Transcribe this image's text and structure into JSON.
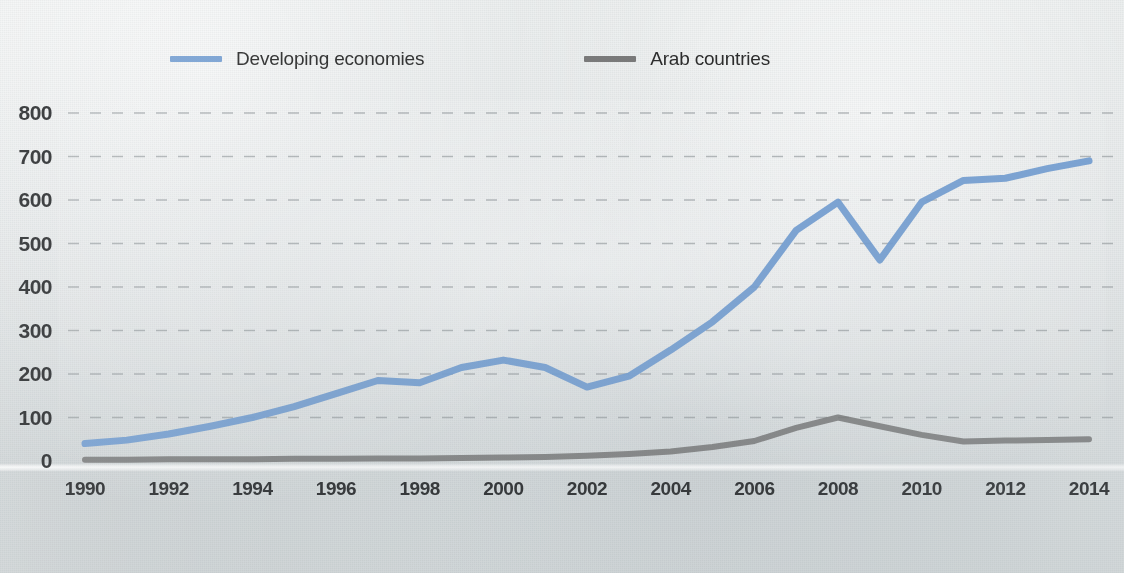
{
  "chart_data": {
    "type": "line",
    "title": "",
    "subtitle": "",
    "xlabel": "",
    "ylabel": "",
    "xlim": [
      1990,
      2014
    ],
    "ylim": [
      0,
      800
    ],
    "grid": true,
    "grid_style": "dashed-horizontal",
    "legend_position": "top-center",
    "x": [
      1990,
      1991,
      1992,
      1993,
      1994,
      1995,
      1996,
      1997,
      1998,
      1999,
      2000,
      2001,
      2002,
      2003,
      2004,
      2005,
      2006,
      2007,
      2008,
      2009,
      2010,
      2011,
      2012,
      2013,
      2014
    ],
    "y_ticks": [
      0,
      100,
      200,
      300,
      400,
      500,
      600,
      700,
      800
    ],
    "y_tick_labels": [
      "0",
      "100",
      "200",
      "300",
      "400",
      "500",
      "600",
      "700",
      "800"
    ],
    "x_ticks": [
      1990,
      1992,
      1994,
      1996,
      1998,
      2000,
      2002,
      2004,
      2006,
      2008,
      2010,
      2012,
      2014
    ],
    "x_tick_labels": [
      "1990",
      "1992",
      "1994",
      "1996",
      "1998",
      "2000",
      "2002",
      "2004",
      "2006",
      "2008",
      "2010",
      "2012",
      "2014"
    ],
    "series": [
      {
        "name": "Developing economies",
        "color": "#6f9bd1",
        "values": [
          40,
          48,
          62,
          80,
          100,
          125,
          155,
          185,
          180,
          215,
          232,
          215,
          170,
          195,
          255,
          320,
          400,
          530,
          595,
          462,
          595,
          645,
          650,
          672,
          690
        ]
      },
      {
        "name": "Arab countries",
        "color": "#6e6e6e",
        "values": [
          3,
          3,
          4,
          4,
          4,
          5,
          5,
          6,
          6,
          7,
          8,
          9,
          12,
          16,
          22,
          32,
          46,
          76,
          100,
          80,
          60,
          45,
          47,
          48,
          50
        ]
      }
    ]
  },
  "legend": {
    "items": [
      {
        "label": "Developing economies",
        "color": "#6f9bd1"
      },
      {
        "label": "Arab countries",
        "color": "#6e6e6e"
      }
    ]
  },
  "axes": {
    "y_labels": [
      "800",
      "700",
      "600",
      "500",
      "400",
      "300",
      "200",
      "100",
      "0"
    ],
    "x_labels": [
      "1990",
      "1992",
      "1994",
      "1996",
      "1998",
      "2000",
      "2002",
      "2004",
      "2006",
      "2008",
      "2010",
      "2012",
      "2014"
    ]
  },
  "colors": {
    "developing_line": "#6f9bd1",
    "arab_line": "#6e6e6e",
    "gridline": "#8d9396",
    "axis_text": "#27292b",
    "background": "#e6e9ea"
  }
}
